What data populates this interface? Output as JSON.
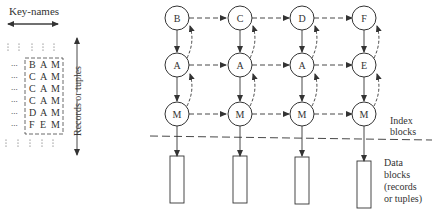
{
  "left_panel": {
    "key_names_label": "Key-names",
    "records_label": "Records or tuples",
    "rows": [
      [
        "B",
        "A",
        "M"
      ],
      [
        "C",
        "A",
        "M"
      ],
      [
        "C",
        "A",
        "M"
      ],
      [
        "C",
        "A",
        "M"
      ],
      [
        "D",
        "A",
        "M"
      ],
      [
        "F",
        "E",
        "M"
      ]
    ],
    "ellipsis": "..."
  },
  "index": {
    "columns": [
      {
        "top": "B",
        "mid": "A",
        "bottom": "M"
      },
      {
        "top": "C",
        "mid": "A",
        "bottom": "M"
      },
      {
        "top": "D",
        "mid": "A",
        "bottom": "M"
      },
      {
        "top": "F",
        "mid": "E",
        "bottom": "M"
      }
    ],
    "index_label_line1": "Index",
    "index_label_line2": "blocks",
    "data_label_line1": "Data",
    "data_label_line2": "blocks",
    "data_label_line3": "(records",
    "data_label_line4": "or tuples)"
  },
  "colors": {
    "stroke": "#3a3a3a",
    "text": "#333333",
    "background": "#ffffff"
  }
}
